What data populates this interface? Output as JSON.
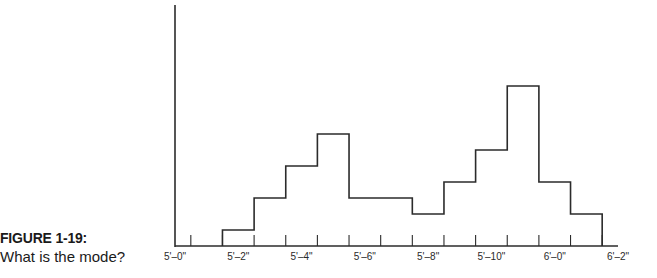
{
  "caption": {
    "figure_label": "FIGURE 1-19:",
    "question": "What is the mode?"
  },
  "chart_data": {
    "type": "bar",
    "subtype": "histogram",
    "title": "",
    "xlabel": "",
    "ylabel": "",
    "grid": false,
    "legend": "none",
    "bin_width_inches": 1,
    "categories": [
      "5'-2\"",
      "5'-3\"",
      "5'-4\"",
      "5'-5\"",
      "5'-6\"",
      "5'-7\"",
      "5'-8\"",
      "5'-9\"",
      "5'-10\"",
      "5'-11\"",
      "6'-0\"",
      "6'-1\""
    ],
    "bin_centers_inches": [
      62,
      63,
      64,
      65,
      66,
      67,
      68,
      69,
      70,
      71,
      72,
      73
    ],
    "values": [
      1,
      3,
      5,
      7,
      3,
      3,
      2,
      4,
      6,
      10,
      4,
      2
    ],
    "xlim_inches": [
      60,
      74
    ],
    "ylim": [
      0,
      15
    ],
    "x_tick_labels": [
      {
        "value": 60,
        "label": "5'–0\""
      },
      {
        "value": 62,
        "label": "5'–2\""
      },
      {
        "value": 64,
        "label": "5'–4\""
      },
      {
        "value": 66,
        "label": "5'–6\""
      },
      {
        "value": 68,
        "label": "5'–8\""
      },
      {
        "value": 70,
        "label": "5'–10\""
      },
      {
        "value": 72,
        "label": "6'–0\""
      },
      {
        "value": 74,
        "label": "6'–2\""
      }
    ],
    "x_minor_tick_step_inches": 1,
    "line_color": "#2b2b2b"
  }
}
